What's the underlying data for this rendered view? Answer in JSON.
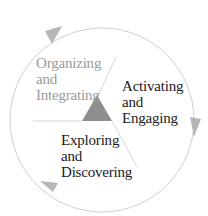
{
  "diagram": {
    "type": "cycle",
    "colors": {
      "circle": "#c8c8c8",
      "arrow": "#b4b4b4",
      "triangle": "#8c8c8c",
      "divider": "#d4d4d4",
      "text_primary": "#1a1a1a",
      "text_secondary": "#9a9a9a"
    },
    "phases": [
      {
        "id": "organizing",
        "lines": [
          "Organizing",
          "and",
          "Integrating"
        ],
        "style": "gray"
      },
      {
        "id": "activating",
        "lines": [
          "Activating",
          "and",
          "Engaging"
        ],
        "style": "dark"
      },
      {
        "id": "exploring",
        "lines": [
          "Exploring",
          "and",
          "Discovering"
        ],
        "style": "dark"
      }
    ],
    "arrows": [
      "clockwise-top-left",
      "clockwise-right",
      "clockwise-bottom-left"
    ],
    "center_icon": "triangle"
  }
}
